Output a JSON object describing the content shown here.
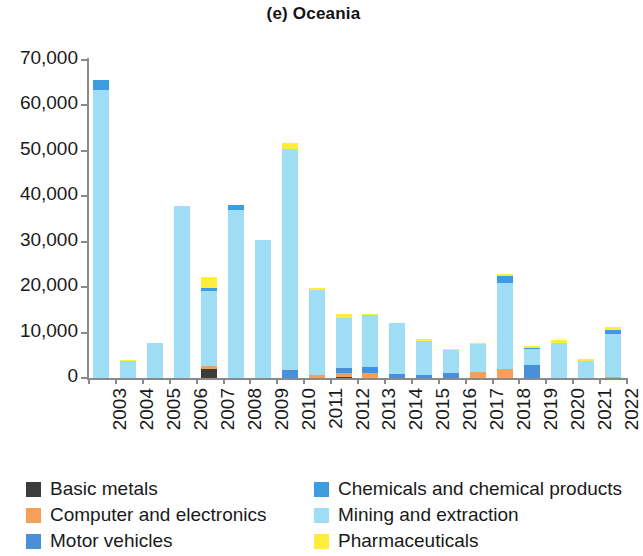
{
  "chart_data": {
    "type": "bar",
    "subtype": "stacked-vertical",
    "title": "(e) Oceania",
    "xlabel": "",
    "ylabel": "",
    "ylim": [
      0,
      70000
    ],
    "ytick_step": 10000,
    "ytick_labels": [
      "70,000",
      "60,000",
      "50,000",
      "40,000",
      "30,000",
      "20,000",
      "10,000",
      "0"
    ],
    "ytick_values": [
      70000,
      60000,
      50000,
      40000,
      30000,
      20000,
      10000,
      0
    ],
    "grid": false,
    "legend_position": "bottom",
    "categories": [
      "2003",
      "2004",
      "2005",
      "2006",
      "2007",
      "2008",
      "2009",
      "2010",
      "2011",
      "2012",
      "2013",
      "2014",
      "2015",
      "2016",
      "2017",
      "2018",
      "2019",
      "2020",
      "2021",
      "2022"
    ],
    "series": [
      {
        "name": "Basic metals",
        "color": "#3c3c3c",
        "values": [
          0,
          0,
          0,
          0,
          2000,
          0,
          0,
          0,
          0,
          300,
          0,
          0,
          0,
          0,
          0,
          0,
          0,
          0,
          0,
          0
        ]
      },
      {
        "name": "Computer and electronics",
        "color": "#f5a05a",
        "values": [
          0,
          0,
          0,
          0,
          600,
          0,
          0,
          0,
          700,
          900,
          1000,
          0,
          0,
          0,
          1400,
          1900,
          0,
          0,
          0,
          300
        ]
      },
      {
        "name": "Motor vehicles",
        "color": "#4a90d9",
        "values": [
          0,
          0,
          0,
          0,
          0,
          0,
          0,
          1700,
          0,
          1100,
          1500,
          800,
          700,
          1200,
          0,
          0,
          2900,
          0,
          0,
          0
        ]
      },
      {
        "name": "Mining and extraction",
        "color": "#9fdef5",
        "values": [
          63500,
          3700,
          7700,
          37800,
          16600,
          37000,
          30400,
          48800,
          18600,
          11000,
          11300,
          11400,
          7500,
          4900,
          6000,
          19000,
          3400,
          7800,
          3800,
          9300
        ]
      },
      {
        "name": "Chemicals and chemical products",
        "color": "#3d9be0",
        "values": [
          2000,
          0,
          0,
          0,
          700,
          1000,
          0,
          0,
          0,
          0,
          0,
          0,
          0,
          0,
          0,
          1500,
          300,
          0,
          0,
          1000
        ]
      },
      {
        "name": "Pharmaceuticals",
        "color": "#ffec3d",
        "values": [
          0,
          300,
          0,
          0,
          2400,
          0,
          0,
          1300,
          500,
          700,
          400,
          0,
          400,
          300,
          400,
          500,
          400,
          600,
          400,
          600
        ]
      }
    ],
    "totals": [
      65500,
      4000,
      7700,
      37800,
      22300,
      38000,
      30400,
      51800,
      19800,
      14000,
      14200,
      12200,
      8600,
      6400,
      7800,
      22900,
      7000,
      8400,
      4200,
      11200
    ]
  },
  "legend": {
    "left_column": [
      {
        "label": "Basic metals",
        "color": "#3c3c3c"
      },
      {
        "label": "Computer and electronics",
        "color": "#f5a05a"
      },
      {
        "label": "Motor vehicles",
        "color": "#4a90d9"
      }
    ],
    "right_column": [
      {
        "label": "Chemicals and chemical products",
        "color": "#3d9be0"
      },
      {
        "label": "Mining and extraction",
        "color": "#9fdef5"
      },
      {
        "label": "Pharmaceuticals",
        "color": "#ffec3d"
      }
    ]
  }
}
